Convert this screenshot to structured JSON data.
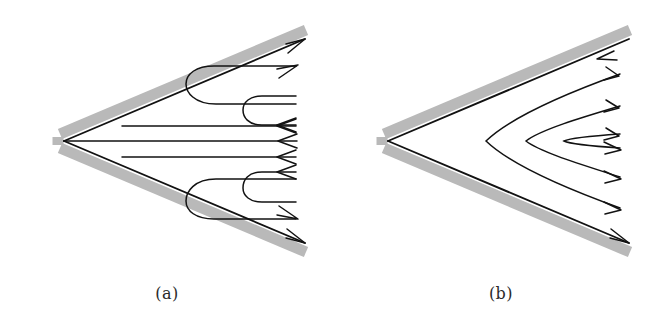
{
  "figure": {
    "kind": "diagram",
    "background_color": "#ffffff",
    "line_color": "#121212",
    "band_color": "#b9b9b9",
    "caption_color": "#2b2b2b",
    "panels": [
      {
        "id": "a",
        "caption": "(a)",
        "vertex": [
          64,
          141
        ],
        "half_angle_deg": 23,
        "wall_length": 262,
        "band_thickness": 10,
        "description": "counterflow wedge pattern: outward flow along both walls, inward flow near the centreline, joined by hairpin turn-around streamlines",
        "streamline_count": 9,
        "arrow_directions": [
          "out",
          "out",
          "in",
          "in",
          "in",
          "in",
          "in",
          "out",
          "out"
        ]
      },
      {
        "id": "b",
        "caption": "(b)",
        "vertex": [
          54,
          141
        ],
        "half_angle_deg": 23,
        "wall_length": 262,
        "band_thickness": 10,
        "description": "through-flow wedge pattern: nested parabola-like streamlines enter along the upper wall, round the corner, and leave along the lower wall",
        "streamline_count": 5,
        "arrow_directions": [
          "in",
          "in",
          "in",
          "out",
          "out"
        ]
      }
    ]
  },
  "captions": {
    "a": "(a)",
    "b": "(b)"
  }
}
